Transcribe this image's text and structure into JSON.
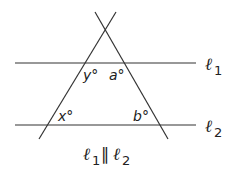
{
  "diagram": {
    "angles": {
      "y": "y°",
      "a": "a°",
      "x": "x°",
      "b": "b°"
    },
    "lines": {
      "l1": {
        "name": "ℓ",
        "sub": "1"
      },
      "l2": {
        "name": "ℓ",
        "sub": "2"
      }
    },
    "caption": {
      "left_name": "ℓ",
      "left_sub": "1",
      "relation": "∥",
      "right_name": "ℓ",
      "right_sub": "2"
    },
    "colors": {
      "stroke": "#333333",
      "text": "#222222"
    }
  }
}
